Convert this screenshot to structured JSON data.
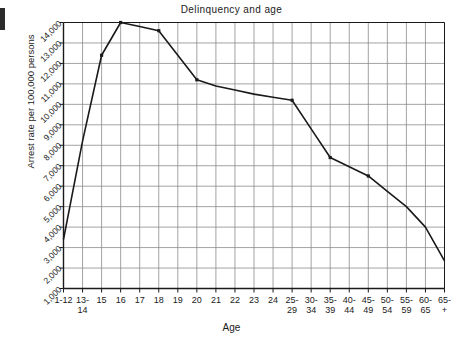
{
  "chart_data": {
    "type": "line",
    "title": "Delinquency and age",
    "xlabel": "Age",
    "ylabel": "Arrest rate per 100,000 persons",
    "grid": true,
    "legend": "none",
    "ylim": [
      1000,
      14000
    ],
    "ytick_values": [
      1000,
      2000,
      3000,
      4000,
      5000,
      6000,
      7000,
      8000,
      9000,
      10000,
      11000,
      12000,
      13000,
      14000
    ],
    "ytick_labels": [
      "1,000",
      "2,000",
      "3,000",
      "4,000",
      "5,000",
      "6,000",
      "7,000",
      "8,000",
      "9,000",
      "10,000",
      "11,000",
      "12,000",
      "13,000",
      "14,000"
    ],
    "categories": [
      "1-12",
      "13-14",
      "15",
      "16",
      "17",
      "18",
      "19",
      "20",
      "21",
      "22",
      "23",
      "24",
      "25-29",
      "30-34",
      "35-39",
      "40-44",
      "45-49",
      "50-54",
      "55-59",
      "60-65",
      "65+"
    ],
    "xtick_labels": [
      {
        "line1": "1-12",
        "line2": ""
      },
      {
        "line1": "13-",
        "line2": "14"
      },
      {
        "line1": "15",
        "line2": ""
      },
      {
        "line1": "16",
        "line2": ""
      },
      {
        "line1": "17",
        "line2": ""
      },
      {
        "line1": "18",
        "line2": ""
      },
      {
        "line1": "19",
        "line2": ""
      },
      {
        "line1": "20",
        "line2": ""
      },
      {
        "line1": "21",
        "line2": ""
      },
      {
        "line1": "22",
        "line2": ""
      },
      {
        "line1": "23",
        "line2": ""
      },
      {
        "line1": "24",
        "line2": ""
      },
      {
        "line1": "25-",
        "line2": "29"
      },
      {
        "line1": "30-",
        "line2": "34"
      },
      {
        "line1": "35-",
        "line2": "39"
      },
      {
        "line1": "40-",
        "line2": "44"
      },
      {
        "line1": "45-",
        "line2": "49"
      },
      {
        "line1": "50-",
        "line2": "54"
      },
      {
        "line1": "55-",
        "line2": "59"
      },
      {
        "line1": "60-",
        "line2": "65"
      },
      {
        "line1": "65-",
        "line2": "+"
      }
    ],
    "series": [
      {
        "name": "Arrest rate",
        "marker": "filled-square",
        "color": "#1a1a1a",
        "values": [
          3400,
          8200,
          12400,
          14000,
          13800,
          13600,
          12400,
          11200,
          10900,
          10700,
          10500,
          10350,
          10200,
          8800,
          7400,
          6950,
          6500,
          5750,
          5000,
          4000,
          2350
        ],
        "marked_points": [
          {
            "x": "15",
            "y": 12400
          },
          {
            "x": "16",
            "y": 14000
          },
          {
            "x": "18",
            "y": 13600
          },
          {
            "x": "20",
            "y": 11200
          },
          {
            "x": "25-29",
            "y": 10200
          },
          {
            "x": "35-39",
            "y": 7400
          },
          {
            "x": "45-49",
            "y": 6500
          }
        ]
      }
    ]
  },
  "figure": {
    "title": "Delinquency and age",
    "x_axis_title": "Age",
    "y_axis_title": "Arrest rate per 100,000 persons",
    "line_color": "#1a1a1a",
    "grid_color": "#8c8c8c",
    "axis_color": "#1a1a1a",
    "background_color": "#ffffff"
  }
}
